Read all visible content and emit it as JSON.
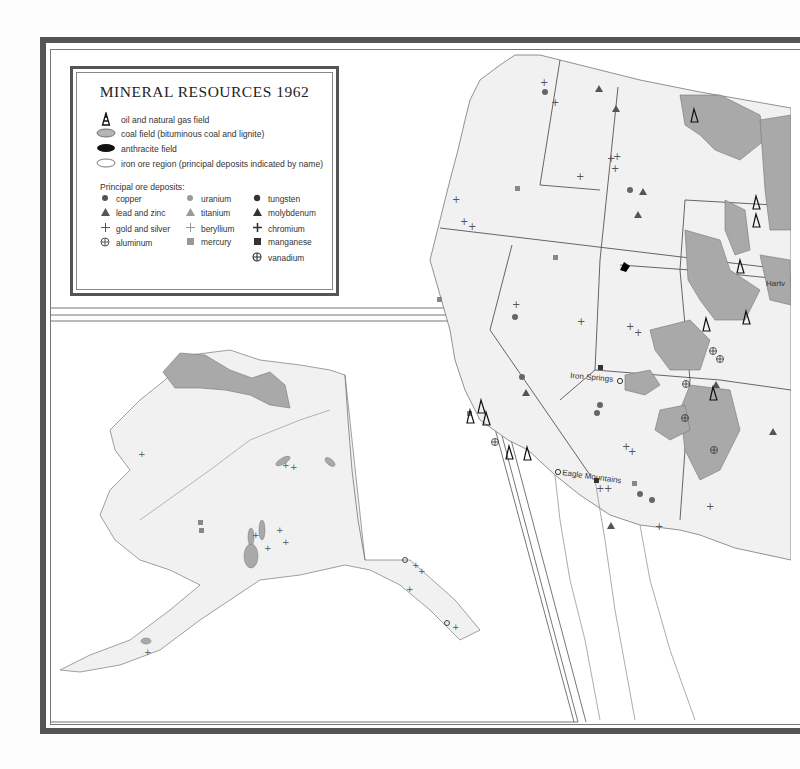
{
  "map": {
    "title": "MINERAL RESOURCES 1962",
    "colors": {
      "frame": "#555555",
      "coal_fill": "#a9a9a9",
      "land_fill": "#f1f1f1",
      "boundary": "#666666",
      "symbol": "#444444",
      "symbol_light": "#8a8a8a"
    },
    "legend": {
      "area_symbols": [
        {
          "icon": "oil-derrick-icon",
          "label": "oil and natural gas field"
        },
        {
          "icon": "coal-field-swatch",
          "label": "coal field (bituminous coal and lignite)"
        },
        {
          "icon": "anthracite-field-swatch",
          "label": "anthracite field"
        },
        {
          "icon": "iron-ore-region-swatch",
          "label": "iron ore region (principal deposits indicated by name)"
        }
      ],
      "ore_heading": "Principal ore deposits:",
      "ore_deposits": [
        {
          "icon": "dark-circle-icon",
          "label": "copper"
        },
        {
          "icon": "dark-triangle-icon",
          "label": "lead and zinc"
        },
        {
          "icon": "plus-icon",
          "label": "gold and silver"
        },
        {
          "icon": "circled-plus-icon",
          "label": "aluminum"
        },
        {
          "icon": "light-circle-icon",
          "label": "uranium"
        },
        {
          "icon": "light-triangle-icon",
          "label": "titanium"
        },
        {
          "icon": "light-plus-icon",
          "label": "beryllium"
        },
        {
          "icon": "light-square-icon",
          "label": "mercury"
        },
        {
          "icon": "black-circle-icon",
          "label": "tungsten"
        },
        {
          "icon": "black-triangle-icon",
          "label": "molybdenum"
        },
        {
          "icon": "bold-plus-icon",
          "label": "chromium"
        },
        {
          "icon": "black-square-icon",
          "label": "manganese"
        },
        {
          "icon": "circled-cross-icon",
          "label": "vanadium"
        }
      ]
    },
    "place_labels": [
      {
        "name": "Iron Springs",
        "region": "Utah"
      },
      {
        "name": "Eagle Mountains",
        "region": "California"
      },
      {
        "name": "Hartv",
        "region": "Wyoming (cut off)"
      }
    ],
    "insets": [
      {
        "name": "Alaska inset",
        "position": "lower-left"
      }
    ]
  }
}
